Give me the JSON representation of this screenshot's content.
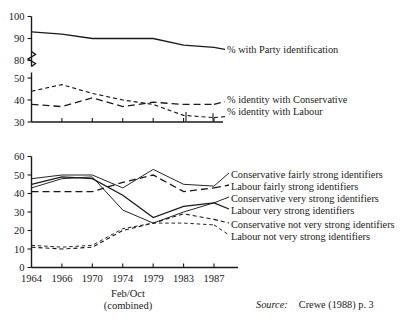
{
  "figure": {
    "source_label": "Source:",
    "source_value": "Crewe (1988) p. 3",
    "x_axis_note_line1": "Feb/Oct",
    "x_axis_note_line2": "(combined)"
  },
  "chart_data": [
    {
      "id": "upper",
      "type": "line",
      "title": "",
      "xlabel": "",
      "ylabel": "",
      "categories": [
        "1964",
        "1966",
        "1970",
        "1974",
        "1979",
        "1983",
        "1987"
      ],
      "yticks_upper": [
        80,
        90,
        100
      ],
      "yticks_lower": [
        30,
        40,
        50
      ],
      "ylim_upper": [
        80,
        100
      ],
      "ylim_lower": [
        30,
        50
      ],
      "axis_break": true,
      "grid": false,
      "legend_position": "right",
      "series": [
        {
          "name": "% with Party identification",
          "style": "solid",
          "values": [
            93,
            92,
            90,
            90,
            90,
            87,
            86
          ]
        },
        {
          "name": "% identity with Conservative",
          "style": "long-dash",
          "values": [
            38,
            37,
            41,
            37,
            39,
            38,
            38
          ]
        },
        {
          "name": "% identity with Labour",
          "style": "short-dash",
          "values": [
            44,
            47,
            43,
            40,
            38,
            33,
            32
          ]
        }
      ]
    },
    {
      "id": "lower",
      "type": "line",
      "title": "",
      "xlabel": "",
      "ylabel": "",
      "categories": [
        "1964",
        "1966",
        "1970",
        "1974",
        "1979",
        "1983",
        "1987"
      ],
      "yticks": [
        0,
        10,
        20,
        30,
        40,
        50,
        60
      ],
      "ylim": [
        0,
        60
      ],
      "grid": false,
      "legend_position": "right",
      "series": [
        {
          "name": "Conservative fairly strong identifiers",
          "style": "thin-solid",
          "values": [
            48,
            50,
            50,
            43,
            53,
            45,
            44
          ]
        },
        {
          "name": "Labour fairly strong identifiers",
          "style": "long-dash",
          "values": [
            41,
            41,
            41,
            46,
            50,
            41,
            43
          ]
        },
        {
          "name": "Conservative very strong identifiers",
          "style": "thin-solid-2",
          "values": [
            43,
            48,
            49,
            31,
            24,
            30,
            35
          ]
        },
        {
          "name": "Labour very strong identifiers",
          "style": "solid",
          "values": [
            45,
            49,
            48,
            39,
            27,
            33,
            35
          ]
        },
        {
          "name": "Conservative not very strong identifiers",
          "style": "short-dash",
          "values": [
            11,
            10,
            11,
            20,
            24,
            29,
            26
          ]
        },
        {
          "name": "Labour not very strong identifiers",
          "style": "fine-dash",
          "values": [
            12,
            11,
            12,
            21,
            24,
            24,
            23
          ]
        }
      ]
    }
  ],
  "upper_axis": {
    "labels": [
      "100",
      "90",
      "80",
      "50",
      "40",
      "30"
    ]
  },
  "lower_axis": {
    "labels": [
      "60",
      "50",
      "40",
      "30",
      "20",
      "10",
      "0"
    ]
  },
  "upper_legend": [
    {
      "label": "% with Party identification"
    },
    {
      "label": "% identity with Conservative"
    },
    {
      "label": "% identity with Labour"
    }
  ],
  "lower_legend": [
    {
      "label": "Conservative fairly strong identifiers"
    },
    {
      "label": "Labour fairly strong identifiers"
    },
    {
      "label": "Conservative very strong identifiers"
    },
    {
      "label": "Labour very strong identifiers"
    },
    {
      "label": "Conservative not very strong identifiers"
    },
    {
      "label": "Labour not very strong identifiers"
    }
  ]
}
